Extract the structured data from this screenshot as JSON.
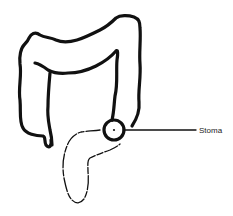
{
  "diagram": {
    "labels": [
      {
        "id": "stoma",
        "text": "Stoma"
      }
    ],
    "colors": {
      "line": "#111111",
      "background": "#ffffff"
    }
  }
}
